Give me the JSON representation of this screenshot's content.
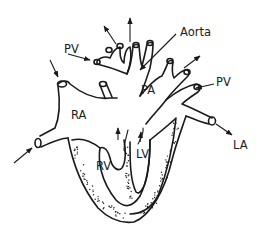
{
  "diagram": {
    "labels": {
      "ra": "RA",
      "rv": "RV",
      "lv": "LV",
      "pa": "PA",
      "aorta": "Aorta",
      "pv_left": "PV",
      "pv_right": "PV",
      "la": "LA"
    },
    "colors": {
      "line": "#1a1a1a",
      "background": "#ffffff"
    }
  }
}
